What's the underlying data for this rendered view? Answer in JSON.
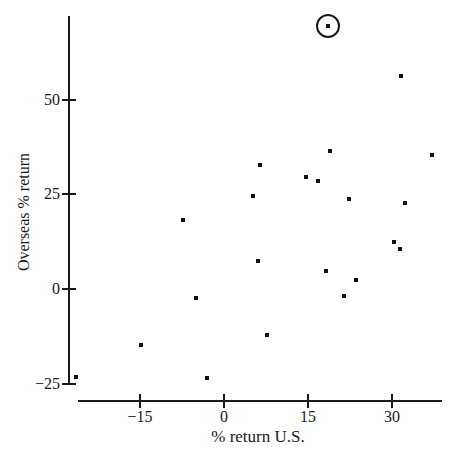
{
  "figure": {
    "background_color": "#ffffff",
    "ink_color": "#1a1a1a",
    "marker_color": "#111111",
    "marker_shape": "filled-square",
    "highlight_shape": "circle-outline"
  },
  "chart_data": {
    "type": "scatter",
    "title": "",
    "xlabel": "% return U.S.",
    "ylabel": "Overseas % return",
    "x_ticks": [
      -15,
      0,
      15,
      30
    ],
    "y_ticks": [
      -25,
      0,
      25,
      50
    ],
    "xlim": [
      -26,
      39
    ],
    "ylim": [
      -25,
      72
    ],
    "grid": false,
    "legend": null,
    "points": [
      {
        "x": 14.6,
        "y": 29.6
      },
      {
        "x": 18.9,
        "y": 36.3
      },
      {
        "x": -14.8,
        "y": -14.9
      },
      {
        "x": -26.4,
        "y": -23.2
      },
      {
        "x": 37.2,
        "y": 35.4
      },
      {
        "x": 23.6,
        "y": 2.5
      },
      {
        "x": -7.4,
        "y": 18.1
      },
      {
        "x": 6.4,
        "y": 32.6
      },
      {
        "x": 18.2,
        "y": 4.8
      },
      {
        "x": 32.3,
        "y": 22.6
      },
      {
        "x": -5.0,
        "y": -2.3
      },
      {
        "x": 21.5,
        "y": -1.9
      },
      {
        "x": 22.4,
        "y": 23.7
      },
      {
        "x": 6.1,
        "y": 7.4
      },
      {
        "x": 31.6,
        "y": 56.2
      },
      {
        "x": 18.6,
        "y": 69.4
      },
      {
        "x": 5.1,
        "y": 24.6
      },
      {
        "x": 16.8,
        "y": 28.6
      },
      {
        "x": 31.5,
        "y": 10.5
      },
      {
        "x": -3.1,
        "y": -23.4
      },
      {
        "x": 30.4,
        "y": 12.5
      },
      {
        "x": 7.6,
        "y": -12.2
      }
    ],
    "circled_point": {
      "x": 18.6,
      "y": 69.4
    }
  }
}
